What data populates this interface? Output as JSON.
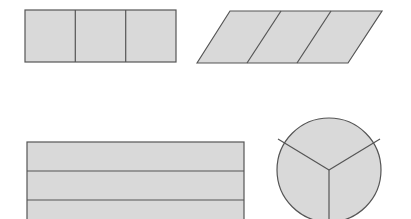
{
  "diagram": {
    "colors": {
      "fill": "#d9d9d9",
      "stroke": "#555555",
      "background": "#ffffff"
    },
    "shapes": [
      {
        "name": "rectangle-thirds-vertical",
        "kind": "rectangle",
        "parts": 3,
        "division": "vertical"
      },
      {
        "name": "parallelogram-thirds",
        "kind": "parallelogram",
        "parts": 3,
        "division": "slanted"
      },
      {
        "name": "rectangle-thirds-horizontal",
        "kind": "rectangle",
        "parts": 3,
        "division": "horizontal"
      },
      {
        "name": "circle-thirds",
        "kind": "circle",
        "parts": 3,
        "division": "radial"
      }
    ]
  }
}
